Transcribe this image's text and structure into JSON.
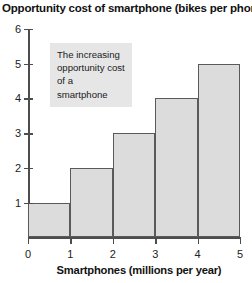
{
  "chart_data": {
    "type": "bar",
    "title": "Opportunity cost of smartphone (bikes per phone)",
    "xlabel": "Smartphones (millions per year)",
    "ylabel": "",
    "categories": [
      "0-1",
      "1-2",
      "2-3",
      "3-4",
      "4-5"
    ],
    "x": [
      0,
      1,
      2,
      3,
      4
    ],
    "values": [
      1,
      2,
      3,
      4,
      5
    ],
    "bar_width": 1,
    "xlim": [
      0,
      5
    ],
    "ylim": [
      0,
      6
    ],
    "xticks": [
      "0",
      "1",
      "2",
      "3",
      "4",
      "5"
    ],
    "yticks": [
      "1",
      "2",
      "3",
      "4",
      "5",
      "6"
    ],
    "grid": false,
    "legend": null,
    "annotations": [
      {
        "text": "The increasing opportunity cost of a smartphone",
        "lines": [
          "The increasing",
          "opportunity cost",
          "of a smartphone"
        ]
      }
    ],
    "colors": {
      "bar_fill": "#dcdcdc",
      "bar_border": "#5a5a5a",
      "axis": "#4d4d4d",
      "annotation_bg": "#e6e6e6",
      "text": "#111111",
      "background": "#ffffff"
    }
  }
}
